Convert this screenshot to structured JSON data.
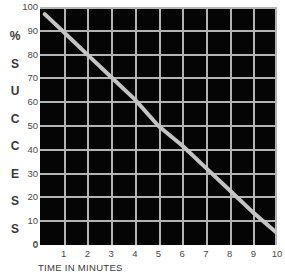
{
  "chart_data": {
    "type": "line",
    "title": "",
    "xlabel": "TIME IN MINUTES",
    "ylabel": "% SUCCESS",
    "ylabel_chars": [
      "%",
      "S",
      "U",
      "C",
      "C",
      "E",
      "S",
      "S"
    ],
    "xlim": [
      0,
      10
    ],
    "ylim": [
      0,
      100
    ],
    "grid": true,
    "legend": "none",
    "x_ticks": [
      1,
      2,
      3,
      4,
      5,
      6,
      7,
      8,
      9,
      10
    ],
    "x_tick_labels": [
      "1",
      "2",
      "3",
      "4",
      "5",
      "6",
      "7",
      "8",
      "9",
      "10"
    ],
    "x_origin_label": "0",
    "y_ticks": [
      0,
      10,
      20,
      30,
      40,
      50,
      60,
      70,
      80,
      90,
      100
    ],
    "y_tick_labels": [
      "100",
      "90",
      "80",
      "70",
      "60",
      "50",
      "40",
      "30",
      "20",
      "10",
      "0"
    ],
    "series": [
      {
        "name": "% Success vs Time",
        "x": [
          0.2,
          1,
          2,
          3,
          4,
          5,
          6,
          7,
          8,
          9,
          10
        ],
        "values": [
          97,
          89.5,
          80,
          70.6,
          61.2,
          50,
          41.8,
          32.4,
          23,
          13.6,
          5
        ]
      }
    ],
    "colors": {
      "plot_background": "#050505",
      "page_background": "#ffffff",
      "grid": "#b4b4b4",
      "line": "#c4c4c4",
      "tick_text": "#4a4a4a",
      "axis_title_text": "#3a3a3a"
    }
  }
}
